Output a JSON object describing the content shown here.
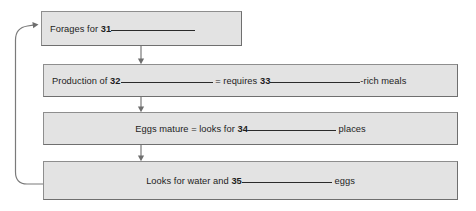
{
  "diagram": {
    "type": "flowchart",
    "colors": {
      "box_fill": "#e3e3e3",
      "box_border": "#8e8e8e",
      "text": "#1d1d1d",
      "connector": "#7a7a7a",
      "background": "#ffffff"
    },
    "boxes": [
      {
        "id": "box-1",
        "align": "left",
        "text_before": "Forages for ",
        "number": "31",
        "text_after": "",
        "blank_after_number": true
      },
      {
        "id": "box-2",
        "align": "left",
        "text_before": "Production of ",
        "number": "32",
        "text_middle": " = requires ",
        "number2": "33",
        "text_after": "-rich meals",
        "blank_after_number": true
      },
      {
        "id": "box-3",
        "align": "center",
        "text_before": "Eggs mature = looks for ",
        "number": "34",
        "text_after": " places",
        "blank_after_number": true
      },
      {
        "id": "box-4",
        "align": "center",
        "text_before": "Looks for water and ",
        "number": "35",
        "text_after": " eggs",
        "blank_after_number": true
      }
    ],
    "connectors": [
      {
        "id": "arrow-1-to-2",
        "from": "box-1",
        "to": "box-2",
        "style": "down-arrow"
      },
      {
        "id": "arrow-2-to-3",
        "from": "box-2",
        "to": "box-3",
        "style": "down-arrow"
      },
      {
        "id": "arrow-3-to-4",
        "from": "box-3",
        "to": "box-4",
        "style": "down-arrow"
      },
      {
        "id": "feedback-loop",
        "from": "box-4",
        "to": "box-1",
        "style": "curved-left-loop-arrow"
      }
    ]
  }
}
